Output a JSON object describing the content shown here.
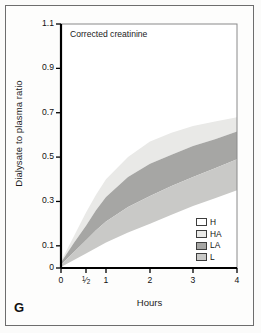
{
  "figure": {
    "panel_letter": "G",
    "background": "#fbfbfa",
    "frame_color": "#6d6d6d"
  },
  "chart_data": {
    "type": "area",
    "title": "Corrected creatinine",
    "xlabel": "Hours",
    "ylabel": "Dialysate to plasma ratio",
    "xlim": [
      0,
      4
    ],
    "ylim": [
      0,
      1.1
    ],
    "grid": false,
    "legend_position": "bottom-right",
    "xtick_labels": [
      "0",
      "½",
      "1",
      "2",
      "3",
      "4"
    ],
    "xtick_values": [
      0,
      0.5,
      1,
      2,
      3,
      4
    ],
    "ytick_labels": [
      "0",
      "0.1",
      "0.3",
      "0.5",
      "0.7",
      "0.9",
      "1.1"
    ],
    "ytick_values": [
      0,
      0.1,
      0.3,
      0.5,
      0.7,
      0.9,
      1.1
    ],
    "x": [
      0,
      0.25,
      0.5,
      0.75,
      1,
      1.5,
      2,
      2.5,
      3,
      3.5,
      4
    ],
    "series": [
      {
        "name": "H",
        "label": "H",
        "color": "#ffffff",
        "upper": [
          0.04,
          0.17,
          0.29,
          0.38,
          0.46,
          0.57,
          0.65,
          0.7,
          0.74,
          0.77,
          0.8
        ],
        "lower": [
          0.03,
          0.14,
          0.25,
          0.33,
          0.4,
          0.5,
          0.57,
          0.61,
          0.64,
          0.66,
          0.68
        ]
      },
      {
        "name": "HA",
        "label": "HA",
        "color": "#e9e9e7",
        "upper": [
          0.03,
          0.14,
          0.25,
          0.33,
          0.4,
          0.5,
          0.57,
          0.61,
          0.64,
          0.66,
          0.68
        ],
        "lower": [
          0.025,
          0.11,
          0.19,
          0.26,
          0.32,
          0.41,
          0.47,
          0.51,
          0.55,
          0.58,
          0.615
        ]
      },
      {
        "name": "LA",
        "label": "LA",
        "color": "#a6a6a4",
        "upper": [
          0.025,
          0.11,
          0.19,
          0.26,
          0.32,
          0.41,
          0.47,
          0.51,
          0.55,
          0.58,
          0.615
        ],
        "lower": [
          0.015,
          0.07,
          0.125,
          0.17,
          0.21,
          0.275,
          0.325,
          0.37,
          0.41,
          0.45,
          0.49
        ]
      },
      {
        "name": "L",
        "label": "L",
        "color": "#c9c9c7",
        "upper": [
          0.015,
          0.07,
          0.125,
          0.17,
          0.21,
          0.275,
          0.325,
          0.37,
          0.41,
          0.45,
          0.49
        ],
        "lower": [
          0.005,
          0.035,
          0.065,
          0.09,
          0.115,
          0.16,
          0.2,
          0.24,
          0.28,
          0.315,
          0.35
        ]
      }
    ],
    "legend_entries": [
      {
        "label": "H",
        "color": "#ffffff"
      },
      {
        "label": "HA",
        "color": "#e9e9e7"
      },
      {
        "label": "LA",
        "color": "#a6a6a4"
      },
      {
        "label": "L",
        "color": "#c9c9c7"
      }
    ]
  }
}
